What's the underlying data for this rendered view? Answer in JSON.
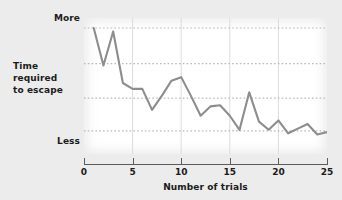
{
  "chart_data": {
    "type": "line",
    "title": "",
    "xlabel": "Number of trials",
    "ylabel": "Time required to escape",
    "ylabel_lines": [
      "Time",
      "required",
      "to escape"
    ],
    "x": [
      1,
      2,
      3,
      4,
      5,
      6,
      7,
      8,
      9,
      10,
      11,
      12,
      13,
      14,
      15,
      16,
      17,
      18,
      19,
      20,
      21,
      22,
      23,
      24,
      25
    ],
    "values": [
      1.0,
      0.68,
      0.97,
      0.53,
      0.48,
      0.48,
      0.3,
      0.42,
      0.55,
      0.58,
      0.42,
      0.25,
      0.33,
      0.34,
      0.25,
      0.13,
      0.45,
      0.2,
      0.13,
      0.21,
      0.1,
      0.14,
      0.18,
      0.09,
      0.11
    ],
    "xlim": [
      0,
      25
    ],
    "ylim": [
      0,
      1
    ],
    "xticks": [
      0,
      5,
      10,
      15,
      20,
      25
    ],
    "xtick_labels": [
      "0",
      "5",
      "10",
      "15",
      "20",
      "25"
    ],
    "ytick_labels": [
      "More",
      "Less"
    ],
    "ytick_positions": [
      1.0,
      0.0
    ],
    "gridlines_horizontal": [
      1.0,
      0.695,
      0.4,
      0.12
    ],
    "gridlines_vertical": [
      5,
      10,
      15,
      20
    ],
    "grid": true,
    "legend": "none",
    "line_color": "#8d8d8d",
    "grid_color": "#b9b9b9",
    "axis_color": "#5a5a5a",
    "text_color": "#1b1b1b",
    "plot_background": "#ffffff",
    "page_background": "#ececec"
  }
}
